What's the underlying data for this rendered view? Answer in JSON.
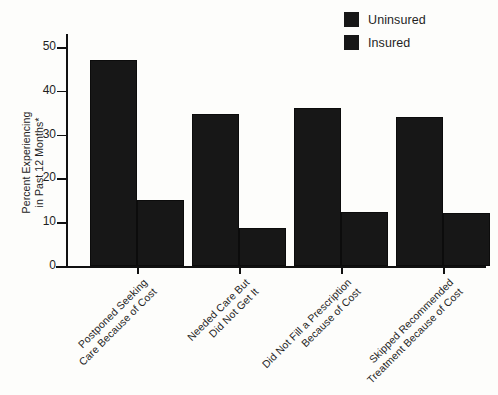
{
  "chart_data": {
    "type": "bar",
    "title": "",
    "xlabel": "",
    "ylabel_line1": "Percent Experiencing",
    "ylabel_line2": "in Past 12 Months*",
    "ylim": [
      0,
      53
    ],
    "yticks": [
      0,
      10,
      20,
      30,
      40,
      50
    ],
    "ytick_labels": [
      "0",
      "10",
      "20",
      "30",
      "40",
      "50"
    ],
    "grid": false,
    "legend_position": "top-right",
    "categories": [
      "Postponed Seeking Care Because of Cost",
      "Needed Care But Did Not Get It",
      "Did Not Fill a Prescription Because of Cost",
      "Skipped Recommended Treatment Because of Cost"
    ],
    "category_lines": [
      [
        "Postponed Seeking",
        "Care Because of Cost"
      ],
      [
        "Needed Care But",
        "Did Not Get It"
      ],
      [
        "Did Not Fill a Prescription",
        "Because of Cost"
      ],
      [
        "Skipped Recommended",
        "Treatment Because of Cost"
      ]
    ],
    "series": [
      {
        "name": "Uninsured",
        "color": "#171717",
        "values": [
          47,
          34.8,
          36,
          34
        ]
      },
      {
        "name": "Insured",
        "color": "#171717",
        "values": [
          15,
          8.7,
          12.4,
          12
        ]
      }
    ]
  },
  "legend": {
    "items": [
      {
        "label": "Uninsured"
      },
      {
        "label": "Insured"
      }
    ]
  }
}
